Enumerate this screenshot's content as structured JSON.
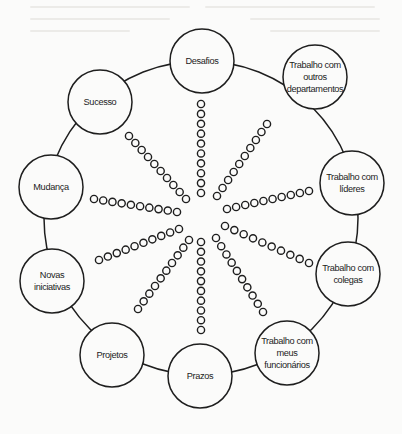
{
  "diagram": {
    "type": "radial-cycle",
    "ring": {
      "cx": 201,
      "cy": 218,
      "r": 157,
      "stroke": "#1e1e1e"
    },
    "node_radius": 32,
    "nodes": [
      {
        "id": "desafios",
        "label": "Desafios",
        "cx": 202,
        "cy": 61
      },
      {
        "id": "outros-departamentos",
        "label": "Trabalho com\noutros\ndepartamentos",
        "cx": 315,
        "cy": 77
      },
      {
        "id": "lideres",
        "label": "Trabalho com\nlíderes",
        "cx": 352,
        "cy": 183
      },
      {
        "id": "colegas",
        "label": "Trabalho com\ncolegas",
        "cx": 348,
        "cy": 274
      },
      {
        "id": "meus-funcionarios",
        "label": "Trabalho com\nmeus\nfuncionários",
        "cx": 287,
        "cy": 353
      },
      {
        "id": "prazos",
        "label": "Prazos",
        "cx": 200,
        "cy": 376
      },
      {
        "id": "projetos",
        "label": "Projetos",
        "cx": 112,
        "cy": 355
      },
      {
        "id": "novas-iniciativas",
        "label": "Novas\niniciativas",
        "cx": 52,
        "cy": 281
      },
      {
        "id": "mudanca",
        "label": "Mudança",
        "cx": 51,
        "cy": 187
      },
      {
        "id": "sucesso",
        "label": "Sucesso",
        "cx": 100,
        "cy": 102
      }
    ],
    "spokes": {
      "beads_per_spoke": 10,
      "bead_radius": 3.6,
      "lines": [
        {
          "name": "spoke-top",
          "x1": 201,
          "y1": 104,
          "x2": 201,
          "y2": 193
        },
        {
          "name": "spoke-upper-right",
          "x1": 267,
          "y1": 124,
          "x2": 217,
          "y2": 196
        },
        {
          "name": "spoke-right-upper",
          "x1": 309,
          "y1": 191,
          "x2": 227,
          "y2": 209
        },
        {
          "name": "spoke-right-lower",
          "x1": 309,
          "y1": 263,
          "x2": 225,
          "y2": 226
        },
        {
          "name": "spoke-lower-right",
          "x1": 263,
          "y1": 312,
          "x2": 216,
          "y2": 238
        },
        {
          "name": "spoke-bottom",
          "x1": 201,
          "y1": 330,
          "x2": 201,
          "y2": 242
        },
        {
          "name": "spoke-lower-left",
          "x1": 138,
          "y1": 309,
          "x2": 189,
          "y2": 240
        },
        {
          "name": "spoke-left-lower",
          "x1": 99,
          "y1": 260,
          "x2": 179,
          "y2": 229
        },
        {
          "name": "spoke-left-upper",
          "x1": 94,
          "y1": 199,
          "x2": 177,
          "y2": 212
        },
        {
          "name": "spoke-upper-left",
          "x1": 129,
          "y1": 136,
          "x2": 186,
          "y2": 199
        }
      ]
    }
  }
}
